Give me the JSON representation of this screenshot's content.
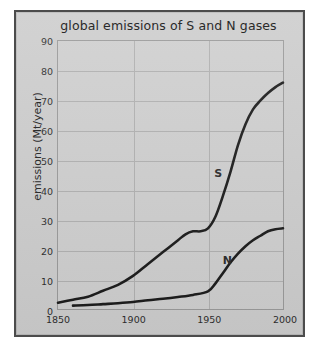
{
  "figure": {
    "title": "global emissions of S and N gases",
    "background_color": "#cdcdcd",
    "border_color": "#4c4c4c",
    "grid_color": "#b0b0b0",
    "line_color": "#1b1b1b"
  },
  "chart_data": {
    "type": "line",
    "title": "global emissions of S and N gases",
    "xlabel": "",
    "ylabel": "emissions (Mt/year)",
    "xlim": [
      1850,
      2000
    ],
    "ylim": [
      0,
      90
    ],
    "xticks": [
      1850,
      1900,
      1950,
      2000
    ],
    "yticks": [
      0,
      10,
      20,
      30,
      40,
      50,
      60,
      70,
      80,
      90
    ],
    "grid": true,
    "legend": "inline-labels",
    "series": [
      {
        "name": "S",
        "label": "S",
        "label_x": 1956,
        "label_y": 46,
        "x": [
          1850,
          1860,
          1870,
          1880,
          1890,
          1900,
          1910,
          1920,
          1930,
          1935,
          1940,
          1945,
          1950,
          1955,
          1960,
          1965,
          1970,
          1975,
          1980,
          1985,
          1990,
          1995,
          2000
        ],
        "y": [
          2,
          3,
          4,
          6,
          8,
          11,
          15,
          19,
          23,
          25,
          26,
          26,
          27,
          31,
          38,
          46,
          55,
          62,
          67,
          70,
          72.5,
          74.5,
          76
        ]
      },
      {
        "name": "N",
        "label": "N",
        "label_x": 1962,
        "label_y": 17,
        "x": [
          1860,
          1870,
          1880,
          1890,
          1900,
          1910,
          1920,
          1930,
          1940,
          1950,
          1955,
          1960,
          1965,
          1970,
          1975,
          1980,
          1985,
          1990,
          1995,
          2000
        ],
        "y": [
          1,
          1.2,
          1.5,
          1.8,
          2.2,
          2.8,
          3.3,
          3.9,
          4.6,
          5.8,
          8.5,
          12,
          15.5,
          18.5,
          21,
          23,
          24.5,
          26,
          26.7,
          27
        ]
      }
    ]
  }
}
